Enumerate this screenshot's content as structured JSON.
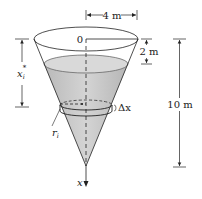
{
  "figure": {
    "labels": {
      "origin": "0",
      "top_radius": "4 m",
      "empty_depth": "2 m",
      "total_height": "10 m",
      "slice_depth": "x",
      "slice_depth_sub": "i",
      "slice_depth_sup": "*",
      "slice_radius": "r",
      "slice_radius_sub": "i",
      "slice_thickness": "Δx",
      "axis": "x"
    },
    "colors": {
      "liquid": "#c8c8c8",
      "liquid_dark": "#a8a8a8",
      "stroke": "#222222",
      "background": "#ffffff"
    }
  }
}
